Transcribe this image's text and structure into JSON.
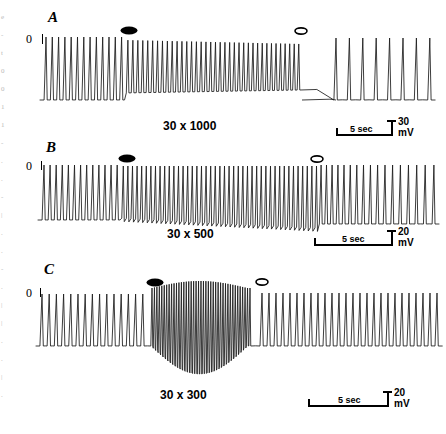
{
  "figure": {
    "type": "electrophysiology-recording",
    "background": "#ffffff",
    "trace_color": "#1a1a1a",
    "panel_count": 3
  },
  "margin_artifact": {
    "fragments": [
      "e",
      "-",
      "t",
      "0",
      "0",
      "1",
      "1",
      "-",
      ".",
      ".",
      "-",
      "|",
      ".",
      ".",
      "-",
      ".",
      "|",
      "|",
      ".",
      ".",
      "|",
      "."
    ]
  },
  "panels": [
    {
      "id": "A",
      "letter": "A",
      "zero_label": "0",
      "caption": "30 x 1000",
      "marker_on": "filled-diamond",
      "marker_off": "open-diamond",
      "scalebar": {
        "time": "5 sec",
        "amplitude": "30",
        "amplitude_unit": "mV"
      },
      "chart_data": {
        "type": "line",
        "title": "30 x 1000",
        "xlabel": "time",
        "ylabel": "membrane potential",
        "ylim": [
          -30,
          30
        ],
        "units": {
          "x": "sec",
          "y": "mV"
        },
        "annotations": [
          {
            "label": "filled-diamond",
            "meaning": "stimulus on",
            "x_frac": 0.29
          },
          {
            "label": "open-diamond",
            "meaning": "stimulus off",
            "x_frac": 0.7
          }
        ],
        "description": "Regular spike train; rate increases slightly after stimulus on; silent gap after stimulus off, then slow low-frequency spikes resume.",
        "spike_count": 46
      }
    },
    {
      "id": "B",
      "letter": "B",
      "zero_label": "0",
      "caption": "30 x 500",
      "marker_on": "filled-diamond",
      "marker_off": "open-diamond",
      "scalebar": {
        "time": "5 sec",
        "amplitude": "20",
        "amplitude_unit": "mV"
      },
      "chart_data": {
        "type": "line",
        "title": "30 x 500",
        "xlabel": "time",
        "ylabel": "membrane potential",
        "ylim": [
          -30,
          30
        ],
        "units": {
          "x": "sec",
          "y": "mV"
        },
        "annotations": [
          {
            "label": "filled-diamond",
            "meaning": "stimulus on",
            "x_frac": 0.29
          },
          {
            "label": "open-diamond",
            "meaning": "stimulus off",
            "x_frac": 0.66
          }
        ],
        "description": "Spike train accelerates and trough level depolarizes after stimulus on; faster firing persists past stimulus off before gradual recovery.",
        "spike_count": 62
      }
    },
    {
      "id": "C",
      "letter": "C",
      "zero_label": "0",
      "caption": "30 x 300",
      "marker_on": "filled-diamond",
      "marker_off": "open-diamond",
      "scalebar": {
        "time": "5 sec",
        "amplitude": "20",
        "amplitude_unit": "mV"
      },
      "chart_data": {
        "type": "line",
        "title": "30 x 300",
        "xlabel": "time",
        "ylabel": "membrane potential",
        "ylim": [
          -40,
          30
        ],
        "units": {
          "x": "sec",
          "y": "mV"
        },
        "annotations": [
          {
            "label": "filled-diamond",
            "meaning": "stimulus on",
            "x_frac": 0.32
          },
          {
            "label": "open-diamond",
            "meaning": "stimulus off",
            "x_frac": 0.59
          }
        ],
        "description": "Large dense high-frequency burst with marked hyperpolarizing excursion between stimulus on and off; after stimulus off the regular slower rhythm returns.",
        "spike_count": 78
      }
    }
  ]
}
